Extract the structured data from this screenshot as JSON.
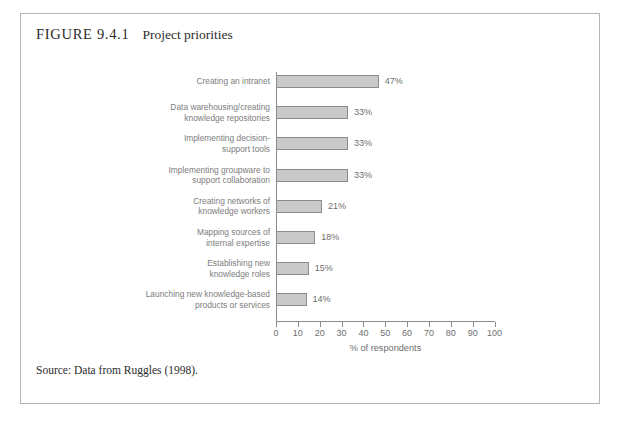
{
  "figure": {
    "number": "FIGURE 9.4.1",
    "title": "Project priorities",
    "source_note": "Source: Data from Ruggles (1998)."
  },
  "colors": {
    "bar_fill": "#c9c9c9",
    "bar_border": "#8c8c8c",
    "axis": "#8c8c8c",
    "label_text": "#7d7d7d",
    "frame": "#b4b4b4"
  },
  "chart_data": {
    "type": "bar",
    "orientation": "horizontal",
    "title": "Project priorities",
    "xlabel": "% of respondents",
    "ylabel": "",
    "xlim": [
      0,
      100
    ],
    "xticks": [
      0,
      10,
      20,
      30,
      40,
      50,
      60,
      70,
      80,
      90,
      100
    ],
    "xtick_labels": [
      "0",
      "10",
      "20",
      "30",
      "40",
      "50",
      "60",
      "70",
      "80",
      "90",
      "100"
    ],
    "grid": false,
    "legend": false,
    "categories": [
      "Creating an intranet",
      "Data warehousing/creating\nknowledge repositories",
      "Implementing decision-\nsupport tools",
      "Implementing groupware to\nsupport collaboration",
      "Creating networks of\nknowledge workers",
      "Mapping sources of\ninternal expertise",
      "Establishing new\nknowledge roles",
      "Launching new knowledge-based\nproducts or services"
    ],
    "values": [
      47,
      33,
      33,
      33,
      21,
      18,
      15,
      14
    ],
    "value_labels": [
      "47%",
      "33%",
      "33%",
      "33%",
      "21%",
      "18%",
      "15%",
      "14%"
    ]
  }
}
